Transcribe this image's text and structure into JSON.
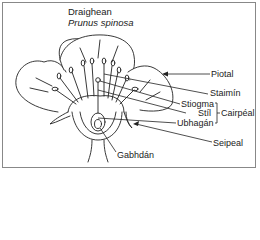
{
  "title": {
    "common_name": "Draighean",
    "scientific_name": "Prunus spinosa"
  },
  "labels": {
    "petal": "Piotal",
    "stamen": "Staimín",
    "stigma": "Stiogma",
    "style": "Stíl",
    "ovary": "Ubhagán",
    "carpel": "Cairpéal",
    "sepal": "Seipeal",
    "receptacle": "Gabhdán"
  },
  "colors": {
    "line": "#222222",
    "frame": "#888888"
  }
}
